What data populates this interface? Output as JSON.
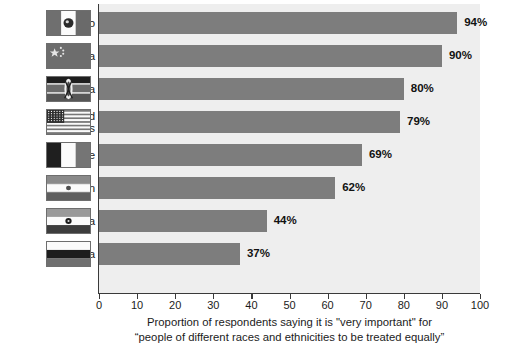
{
  "chart_data": {
    "type": "bar",
    "orientation": "horizontal",
    "title": "",
    "categories": [
      "Mexico",
      "China",
      "Kenya",
      "United States",
      "France",
      "Iran",
      "India",
      "Russia"
    ],
    "values": [
      94,
      90,
      80,
      79,
      69,
      62,
      44,
      37
    ],
    "value_labels": [
      "94%",
      "90%",
      "80%",
      "79%",
      "69%",
      "62%",
      "44%",
      "37%"
    ],
    "xlabel": "",
    "ylabel": "",
    "xlim": [
      0,
      100
    ],
    "xticks": [
      0,
      10,
      20,
      30,
      40,
      50,
      60,
      70,
      80,
      90,
      100
    ],
    "xtick_labels": [
      "0",
      "10",
      "20",
      "30",
      "40",
      "50",
      "60",
      "70",
      "80",
      "90",
      "100"
    ],
    "grid": false,
    "legend": "none",
    "bar_color": "#7d7d7d",
    "plot_background": "#eeeeee",
    "caption_line1": "Proportion of respondents saying it is \"very important\" for",
    "caption_line2": "“people of different races and ethnicities to be treated equally”"
  },
  "rows": [
    {
      "label": "Mexico",
      "label_lines": "Mexico",
      "value": 94,
      "value_label": "94%",
      "flag": "mexico-flag"
    },
    {
      "label": "China",
      "label_lines": "China",
      "value": 90,
      "value_label": "90%",
      "flag": "china-flag"
    },
    {
      "label": "Kenya",
      "label_lines": "Kenya",
      "value": 80,
      "value_label": "80%",
      "flag": "kenya-flag"
    },
    {
      "label": "United States",
      "label_lines": "United\nStates",
      "value": 79,
      "value_label": "79%",
      "flag": "united-states-flag"
    },
    {
      "label": "France",
      "label_lines": "France",
      "value": 69,
      "value_label": "69%",
      "flag": "france-flag"
    },
    {
      "label": "Iran",
      "label_lines": "Iran",
      "value": 62,
      "value_label": "62%",
      "flag": "iran-flag"
    },
    {
      "label": "India",
      "label_lines": "India",
      "value": 44,
      "value_label": "44%",
      "flag": "india-flag"
    },
    {
      "label": "Russia",
      "label_lines": "Russia",
      "value": 37,
      "value_label": "37%",
      "flag": "russia-flag"
    }
  ]
}
